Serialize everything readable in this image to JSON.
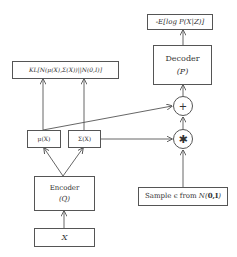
{
  "diagram": {
    "type": "variational-autoencoder",
    "nodes": {
      "loss_recon": {
        "label": "-E[log P(X|Z)]"
      },
      "decoder": {
        "label": "Decoder",
        "sublabel": "(P)"
      },
      "plus": {
        "symbol": "+"
      },
      "multiply": {
        "symbol": "✱"
      },
      "kl": {
        "label": "KL[N(μ(X),Σ(X))||N(0,I)]"
      },
      "mu": {
        "label": "μ(X)"
      },
      "sigma": {
        "label": "Σ(X)"
      },
      "encoder": {
        "label": "Encoder",
        "sublabel": "(Q)"
      },
      "input": {
        "label": "X"
      },
      "sample": {
        "label_prefix": "Sample ϵ from ",
        "label_dist": "N(",
        "label_params": "0,I",
        "label_close": ")"
      }
    },
    "edges": [
      {
        "from": "input",
        "to": "encoder"
      },
      {
        "from": "encoder",
        "to": "mu"
      },
      {
        "from": "encoder",
        "to": "sigma"
      },
      {
        "from": "mu",
        "to": "kl"
      },
      {
        "from": "sigma",
        "to": "kl"
      },
      {
        "from": "mu",
        "to": "plus"
      },
      {
        "from": "sigma",
        "to": "multiply"
      },
      {
        "from": "sample",
        "to": "multiply"
      },
      {
        "from": "multiply",
        "to": "plus"
      },
      {
        "from": "plus",
        "to": "decoder"
      },
      {
        "from": "decoder",
        "to": "loss_recon"
      }
    ],
    "colors": {
      "line": "#555555",
      "text": "#333333",
      "background": "#ffffff"
    }
  }
}
